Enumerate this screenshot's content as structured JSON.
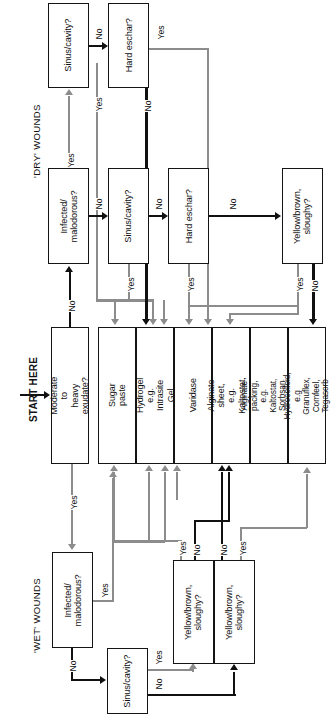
{
  "sections": {
    "dry_label": "'DRY' WOUNDS",
    "wet_label": "'WET' WOUNDS",
    "start_label": "START HERE"
  },
  "edge_labels": {
    "yes": "Yes",
    "no": "No"
  },
  "dry": {
    "sinus_cavity_top": "Sinus/cavity?",
    "hard_eschar_top": "Hard eschar?",
    "infected": "Infected/\nmalodorous?",
    "sinus_cavity": "Sinus/cavity?",
    "hard_eschar": "Hard eschar?",
    "yellow_brown": "Yellow/brown,\nsloughy?"
  },
  "start": {
    "moderate_exudate": "Moderate to\nheavy exudate?"
  },
  "treatments": [
    {
      "id": "sugar-paste",
      "label": "Sugar paste"
    },
    {
      "id": "hydrogel",
      "label": "Hydrogel\ne.g. Intrasite Gel"
    },
    {
      "id": "varidase",
      "label": "Varidase"
    },
    {
      "id": "alginate-sheet",
      "label": "Alginate sheet,\ne.g. Kaltostat, Sorbsan"
    },
    {
      "id": "alginate-packing",
      "label": "Alginate packing,\ne.g. Kaltostat, Sorbsan robe"
    },
    {
      "id": "hydrocolloid",
      "label": "Hydrocolloid, e.g Granuflex,\nComfeel, Tegasorb"
    }
  ],
  "wet": {
    "infected": "Infected/\nmalodorous?",
    "sinus_cavity": "Sinus/cavity?",
    "yellow_brown_left": "Yellow/brown,\nsloughy?",
    "yellow_brown_right": "Yellow/brown,\nsloughy?"
  },
  "colors": {
    "line_gray": "#8c8c8c",
    "line_black": "#111111",
    "box_border": "#141414",
    "background": "#ffffff"
  }
}
